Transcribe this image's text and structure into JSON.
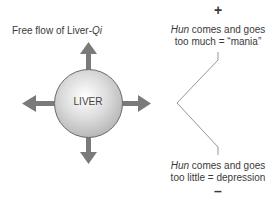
{
  "diagram": {
    "title_prefix": "Free flow of Liver-",
    "title_italic": "Qi",
    "center_label": "LIVER",
    "plus_sign": "+",
    "minus_sign": "–",
    "top_note": {
      "italic": "Hun",
      "line1_rest": " comes and goes",
      "line2": "too much = “mania”"
    },
    "bottom_note": {
      "italic": "Hun",
      "line1_rest": " comes and goes",
      "line2": "too little = depression"
    },
    "colors": {
      "arrow": "#7a7a7a",
      "circle_edge": "#6a6a6a",
      "line": "#8a8a8a",
      "text": "#3a3a3a"
    }
  }
}
